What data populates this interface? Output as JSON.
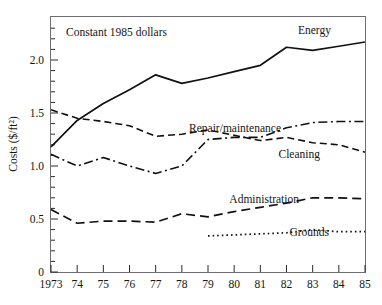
{
  "chart_data": {
    "type": "line",
    "title": "",
    "annotation": "Constant 1985 dollars",
    "xlabel": "",
    "ylabel": "Costs ($/ft²)",
    "x": [
      1973,
      1974,
      1975,
      1976,
      1977,
      1978,
      1979,
      1980,
      1981,
      1982,
      1983,
      1984,
      1985
    ],
    "xtick_labels": [
      "1973",
      "74",
      "75",
      "76",
      "77",
      "78",
      "79",
      "80",
      "81",
      "82",
      "83",
      "84",
      "85"
    ],
    "ytick_labels": [
      "0",
      "0.5",
      "1.0",
      "1.5",
      "2.0"
    ],
    "ytick_values": [
      0,
      0.5,
      1.0,
      1.5,
      2.0
    ],
    "yminor_step": 0.1,
    "xlim": [
      1973,
      1985
    ],
    "ylim": [
      0,
      2.3
    ],
    "grid": false,
    "legend_position": "inline-right-of-series",
    "series": [
      {
        "name": "Energy",
        "label": "Energy",
        "linestyle": "solid",
        "color": "#111111",
        "width": 1.7,
        "values": [
          1.18,
          1.43,
          1.59,
          1.72,
          1.86,
          1.78,
          1.83,
          1.89,
          1.95,
          2.12,
          2.09,
          2.13,
          2.17
        ]
      },
      {
        "name": "Cleaning",
        "label": "Cleaning",
        "linestyle": "dashed",
        "color": "#111111",
        "width": 1.6,
        "values": [
          1.53,
          1.45,
          1.42,
          1.38,
          1.28,
          1.3,
          1.34,
          1.29,
          1.24,
          1.27,
          1.22,
          1.2,
          1.13
        ]
      },
      {
        "name": "Repair/maintenance",
        "label": "Repair/maintenance",
        "linestyle": "dashdot",
        "color": "#111111",
        "width": 1.6,
        "values": [
          1.11,
          1.0,
          1.08,
          1.0,
          0.93,
          1.0,
          1.25,
          1.27,
          1.27,
          1.36,
          1.41,
          1.42,
          1.42
        ]
      },
      {
        "name": "Administration",
        "label": "Administration",
        "linestyle": "dashed-long",
        "color": "#111111",
        "width": 1.7,
        "values": [
          0.59,
          0.46,
          0.48,
          0.48,
          0.47,
          0.55,
          0.52,
          0.57,
          0.61,
          0.65,
          0.7,
          0.7,
          0.69
        ]
      },
      {
        "name": "Grounds",
        "label": "Grounds",
        "linestyle": "dotted",
        "color": "#111111",
        "width": 1.7,
        "start_year": 1979,
        "values": [
          null,
          null,
          null,
          null,
          null,
          null,
          0.34,
          0.35,
          0.36,
          0.37,
          0.4,
          0.38,
          0.38
        ]
      }
    ],
    "series_labels": [
      {
        "text": "Energy",
        "x": 331,
        "y": 34
      },
      {
        "text": "Repair/maintenance",
        "x": 281,
        "y": 132
      },
      {
        "text": "Cleaning",
        "x": 320,
        "y": 158
      },
      {
        "text": "Administration",
        "x": 299,
        "y": 203
      },
      {
        "text": "Grounds",
        "x": 329,
        "y": 236
      }
    ]
  },
  "figure": {
    "caption": ""
  }
}
